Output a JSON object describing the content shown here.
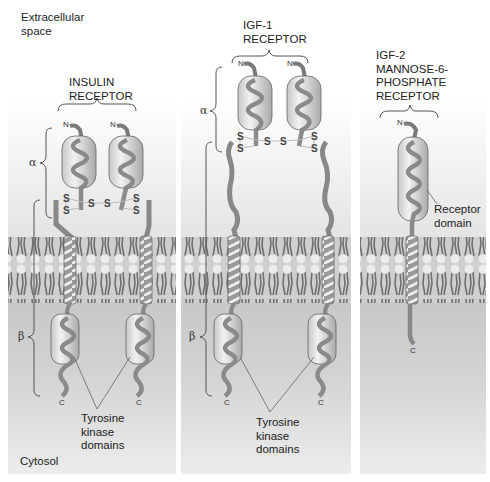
{
  "labels": {
    "extracellular": "Extracellular\nspace",
    "cytosol": "Cytosol"
  },
  "panels": [
    {
      "id": "insulin",
      "title": "INSULIN\nRECEPTOR",
      "alpha": "α",
      "beta": "β",
      "n_label": "N",
      "c_label": "C",
      "disulfide": "S",
      "callout": "Tyrosine\nkinase\ndomains"
    },
    {
      "id": "igf1",
      "title": "IGF-1\nRECEPTOR",
      "alpha": "α",
      "beta": "β",
      "n_label": "N",
      "c_label": "C",
      "disulfide": "S",
      "callout": "Tyrosine\nkinase\ndomains"
    },
    {
      "id": "igf2",
      "title": "IGF-2\nMANNOSE-6-\nPHOSPHATE\nRECEPTOR",
      "n_label": "N",
      "c_label": "C",
      "callout": "Receptor\ndomain"
    }
  ],
  "colors": {
    "membrane_bg": "#cfcfcf",
    "lipid_head": "#e6e6e6",
    "lipid_tail": "#6e6e6e",
    "protein": "#8a8a8a",
    "domain_fill": "#b8b8b8",
    "cytosol": "#c8c8c8"
  }
}
